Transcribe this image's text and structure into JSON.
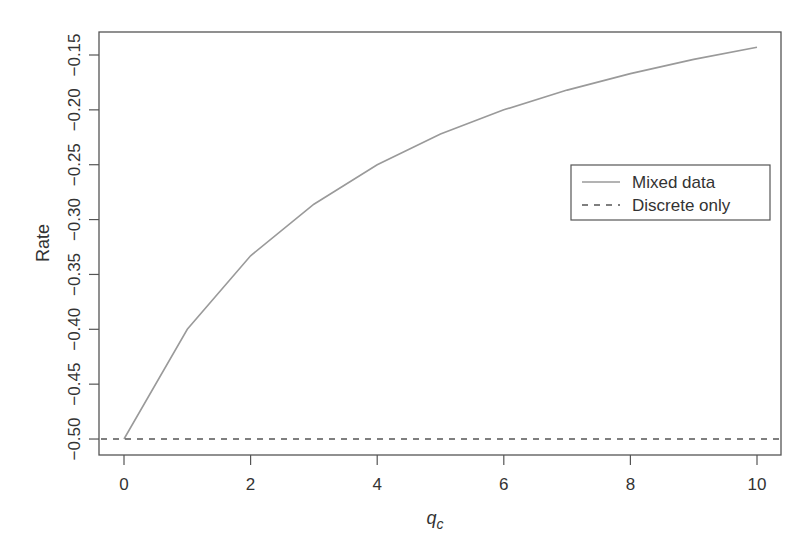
{
  "chart_data": {
    "type": "line",
    "title": "",
    "xlabel": "q_c",
    "ylabel": "Rate",
    "xlim": [
      -0.4,
      10.4
    ],
    "ylim": [
      -0.523,
      -0.133
    ],
    "x_ticks": [
      0,
      2,
      4,
      6,
      8,
      10
    ],
    "x_tick_labels": [
      "0",
      "2",
      "4",
      "6",
      "8",
      "10"
    ],
    "y_ticks": [
      -0.5,
      -0.45,
      -0.4,
      -0.35,
      -0.3,
      -0.25,
      -0.2,
      -0.15
    ],
    "y_tick_labels": [
      "−0.50",
      "−0.45",
      "−0.40",
      "−0.35",
      "−0.30",
      "−0.25",
      "−0.20",
      "−0.15"
    ],
    "grid": false,
    "legend_position": "right-middle",
    "x": [
      0,
      1,
      2,
      3,
      4,
      5,
      6,
      7,
      8,
      9,
      10
    ],
    "series": [
      {
        "name": "Mixed data",
        "style": "solid",
        "color": "#9a9a9a",
        "values": [
          -0.5,
          -0.4,
          -0.333,
          -0.286,
          -0.25,
          -0.222,
          -0.2,
          -0.182,
          -0.167,
          -0.154,
          -0.143
        ]
      },
      {
        "name": "Discrete only",
        "style": "dashed",
        "color": "#555555",
        "values": [
          -0.5,
          -0.5,
          -0.5,
          -0.5,
          -0.5,
          -0.5,
          -0.5,
          -0.5,
          -0.5,
          -0.5,
          -0.5
        ]
      }
    ]
  },
  "labels": {
    "xlabel_main": "q",
    "xlabel_sub": "c",
    "ylabel": "Rate",
    "legend": [
      "Mixed data",
      "Discrete only"
    ]
  }
}
